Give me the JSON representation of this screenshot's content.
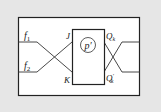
{
  "diagram": {
    "block_label": "p′",
    "inputs": [
      {
        "label": "f",
        "sub": "1"
      },
      {
        "label": "f",
        "sub": "2"
      }
    ],
    "ports_in": [
      "J",
      "K"
    ],
    "ports_out": [
      {
        "label": "Q",
        "sub": "k",
        "prime": ""
      },
      {
        "label": "Q",
        "sub": "k",
        "prime": "′"
      }
    ],
    "colors": {
      "background": "#e6e6e6",
      "frame_fill": "#ffffff",
      "stroke": "#222222"
    }
  }
}
